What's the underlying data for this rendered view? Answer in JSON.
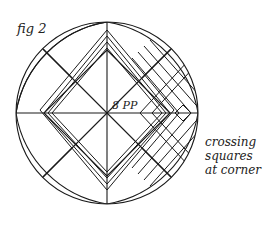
{
  "figure": {
    "label": "fig 2",
    "center_label": "8 PP",
    "caption_lines": [
      "crossing",
      "squares",
      "at corner"
    ]
  },
  "colors": {
    "stroke": "#1a1a1a",
    "background": "#ffffff"
  }
}
